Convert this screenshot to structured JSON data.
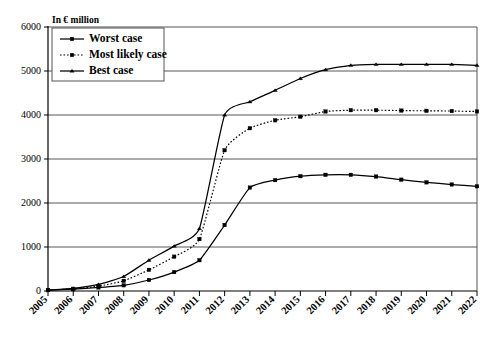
{
  "chart_data": {
    "type": "line",
    "title": "",
    "subtitle": "",
    "xlabel": "",
    "ylabel": "In € million",
    "axis_note": "In € million",
    "grid": true,
    "legend_position": "top-left",
    "xlim": [
      2005,
      2022
    ],
    "ylim": [
      0,
      6000
    ],
    "ytick_values": [
      0,
      1000,
      2000,
      3000,
      4000,
      5000,
      6000
    ],
    "ytick_labels": [
      "0",
      "1000",
      "2000",
      "3000",
      "4000",
      "5000",
      "6000"
    ],
    "categories": [
      "2005",
      "2006",
      "2007",
      "2008",
      "2009",
      "2010",
      "2011",
      "2012",
      "2013",
      "2014",
      "2015",
      "2016",
      "2017",
      "2018",
      "2019",
      "2020",
      "2021",
      "2022"
    ],
    "x": [
      2005,
      2006,
      2007,
      2008,
      2009,
      2010,
      2011,
      2012,
      2013,
      2014,
      2015,
      2016,
      2017,
      2018,
      2019,
      2020,
      2021,
      2022
    ],
    "series": [
      {
        "name": "Worst case",
        "marker": "square",
        "linestyle": "solid",
        "color": "#000000",
        "values": [
          20,
          40,
          80,
          130,
          250,
          430,
          700,
          1500,
          2350,
          2520,
          2610,
          2640,
          2640,
          2600,
          2530,
          2470,
          2420,
          2380
        ]
      },
      {
        "name": "Most likely case",
        "marker": "square",
        "linestyle": "dotted",
        "color": "#000000",
        "values": [
          20,
          50,
          110,
          230,
          480,
          780,
          1180,
          3200,
          3700,
          3880,
          3960,
          4080,
          4110,
          4110,
          4100,
          4095,
          4090,
          4080
        ]
      },
      {
        "name": "Best case",
        "marker": "triangle",
        "linestyle": "solid",
        "color": "#000000",
        "values": [
          20,
          60,
          150,
          330,
          700,
          1020,
          1420,
          4000,
          4300,
          4560,
          4830,
          5030,
          5130,
          5150,
          5150,
          5150,
          5150,
          5130
        ]
      }
    ],
    "legend": [
      "Worst case",
      "Most likely case",
      "Best case"
    ]
  }
}
